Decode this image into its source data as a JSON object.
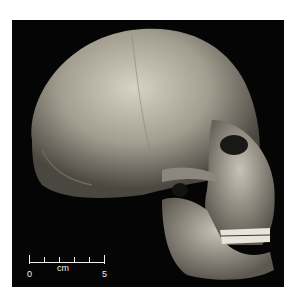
{
  "photo": {
    "subject": "hominin skull, right lateral view",
    "background_color": "#050505"
  },
  "scale_bar": {
    "unit": "cm",
    "start_label": "0",
    "end_label": "5",
    "ticks": 6
  }
}
